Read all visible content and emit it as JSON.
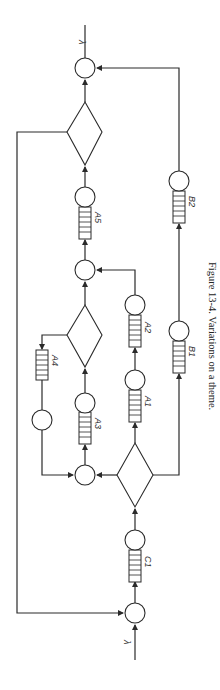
{
  "figure": {
    "caption": "Figure 13-4.  Variations on a theme.",
    "input_label": "λ",
    "output_label": "λ"
  },
  "queues": {
    "C1": "C1",
    "A1": "A1",
    "A2": "A2",
    "A3": "A3",
    "A4": "A4",
    "A5": "A5",
    "B1": "B1",
    "B2": "B2"
  },
  "colors": {
    "line": "#2a2a2a",
    "background": "#ffffff"
  }
}
